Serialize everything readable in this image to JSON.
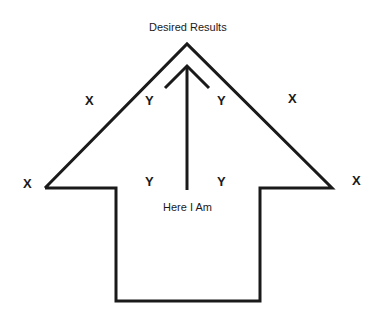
{
  "diagram": {
    "title": "Desired Results",
    "start_label": "Here I Am",
    "outside_marks": [
      "X",
      "X",
      "X",
      "X"
    ],
    "inside_marks": [
      "Y",
      "Y",
      "Y",
      "Y"
    ],
    "line_color": "#1a1a1a"
  }
}
